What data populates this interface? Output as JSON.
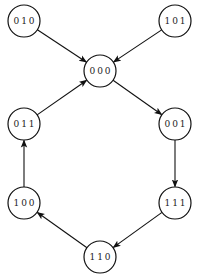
{
  "diagram": {
    "type": "directed-graph",
    "colors": {
      "stroke": "#111111",
      "text": "#222222",
      "background": "#ffffff"
    },
    "node_radius": 16,
    "nodes": [
      {
        "id": "010",
        "label": "010",
        "x": 24,
        "y": 21
      },
      {
        "id": "101",
        "label": "101",
        "x": 175,
        "y": 21
      },
      {
        "id": "000",
        "label": "000",
        "x": 100,
        "y": 71
      },
      {
        "id": "011",
        "label": "011",
        "x": 24,
        "y": 124
      },
      {
        "id": "001",
        "label": "001",
        "x": 175,
        "y": 124
      },
      {
        "id": "100",
        "label": "100",
        "x": 24,
        "y": 203
      },
      {
        "id": "111",
        "label": "111",
        "x": 175,
        "y": 203
      },
      {
        "id": "110",
        "label": "110",
        "x": 100,
        "y": 257
      }
    ],
    "edges": [
      {
        "from": "010",
        "to": "000"
      },
      {
        "from": "101",
        "to": "000"
      },
      {
        "from": "011",
        "to": "000"
      },
      {
        "from": "000",
        "to": "001"
      },
      {
        "from": "001",
        "to": "111"
      },
      {
        "from": "111",
        "to": "110"
      },
      {
        "from": "110",
        "to": "100"
      },
      {
        "from": "100",
        "to": "011"
      }
    ]
  }
}
